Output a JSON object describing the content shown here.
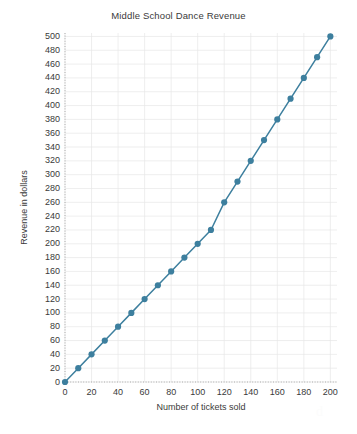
{
  "chart_data": {
    "type": "line",
    "title": "Middle School Dance Revenue",
    "xlabel": "Number of tickets sold",
    "ylabel": "Revenue in dollars",
    "xlim": [
      0,
      205
    ],
    "ylim": [
      0,
      505
    ],
    "xticks": [
      0,
      20,
      40,
      60,
      80,
      100,
      120,
      140,
      160,
      180,
      200
    ],
    "yticks": [
      0,
      20,
      40,
      60,
      80,
      100,
      120,
      140,
      160,
      180,
      200,
      220,
      240,
      260,
      280,
      300,
      320,
      340,
      360,
      380,
      400,
      420,
      440,
      460,
      480,
      500
    ],
    "grid": true,
    "legend": "none",
    "marker": "circle",
    "series": [
      {
        "name": "Revenue",
        "color": "#3d7f9e",
        "x": [
          0,
          10,
          20,
          30,
          40,
          50,
          60,
          70,
          80,
          90,
          100,
          110,
          120,
          130,
          140,
          150,
          160,
          170,
          180,
          190,
          200
        ],
        "y": [
          0,
          20,
          40,
          60,
          80,
          100,
          120,
          140,
          160,
          180,
          200,
          220,
          260,
          290,
          320,
          350,
          380,
          410,
          440,
          470,
          500
        ]
      }
    ]
  },
  "watermark": {
    "text": "d"
  }
}
